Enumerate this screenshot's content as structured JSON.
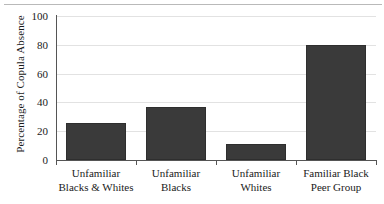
{
  "chart_data": {
    "type": "bar",
    "title": "",
    "xlabel": "",
    "ylabel": "Percentage of Copula Absence",
    "categories": [
      "Unfamiliar Blacks & Whites",
      "Unfamiliar Blacks",
      "Unfamiliar Whites",
      "Familiar Black Peer Group"
    ],
    "category_lines": [
      [
        "Unfamiliar",
        "Blacks & Whites"
      ],
      [
        "Unfamiliar",
        "Blacks"
      ],
      [
        "Unfamiliar",
        "Whites"
      ],
      [
        "Familiar Black",
        "Peer Group"
      ]
    ],
    "values": [
      26,
      37,
      11,
      80
    ],
    "ylim": [
      0,
      100
    ],
    "yticks": [
      0,
      20,
      40,
      60,
      80,
      100
    ],
    "ytick_labels": [
      "0",
      "20",
      "40",
      "60",
      "80",
      "100"
    ],
    "grid": true,
    "legend": null,
    "bar_color": "#3a3a3a",
    "gridline_color": "#e2e2e2",
    "axis_color": "#555555",
    "background_color": "#ffffff"
  }
}
